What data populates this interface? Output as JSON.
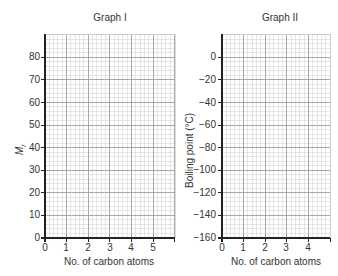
{
  "chart_data": [
    {
      "type": "line",
      "title": "Graph I",
      "xlabel": "No. of carbon atoms",
      "ylabel": "M_r",
      "ylabel_main": "M",
      "ylabel_sub": "r",
      "x_ticks": [
        "0",
        "1",
        "2",
        "3",
        "4",
        "5"
      ],
      "y_ticks": [
        "0",
        "10",
        "20",
        "30",
        "40",
        "50",
        "60",
        "70",
        "80"
      ],
      "xlim": [
        0,
        6
      ],
      "ylim": [
        0,
        90
      ],
      "grid": true,
      "series": []
    },
    {
      "type": "line",
      "title": "Graph II",
      "xlabel": "No. of carbon atoms",
      "ylabel": "Boiling point (°C)",
      "x_ticks": [
        "0",
        "1",
        "2",
        "3",
        "4"
      ],
      "y_ticks": [
        "0",
        "−20",
        "−40",
        "−60",
        "−80",
        "−100",
        "−120",
        "−140",
        "−160"
      ],
      "xlim": [
        0,
        5
      ],
      "ylim": [
        -160,
        10
      ],
      "grid": true,
      "series": []
    }
  ],
  "graph1": {
    "title": "Graph I",
    "xlabel": "No. of carbon atoms",
    "ylabel_main": "M",
    "ylabel_sub": "r",
    "x_ticks": [
      "0",
      "1",
      "2",
      "3",
      "4",
      "5"
    ],
    "y_ticks": [
      "0",
      "10",
      "20",
      "30",
      "40",
      "50",
      "60",
      "70",
      "80"
    ]
  },
  "graph2": {
    "title": "Graph II",
    "xlabel": "No. of carbon atoms",
    "ylabel": "Boiling point (°C)",
    "x_ticks": [
      "0",
      "1",
      "2",
      "3",
      "4"
    ],
    "y_ticks": [
      "0",
      "−20",
      "−40",
      "−60",
      "−80",
      "−100",
      "−120",
      "−140",
      "−160"
    ]
  },
  "colors": {
    "major_grid": "#9a9a9a",
    "minor_grid": "#d6d6d6",
    "axis": "#222222"
  }
}
